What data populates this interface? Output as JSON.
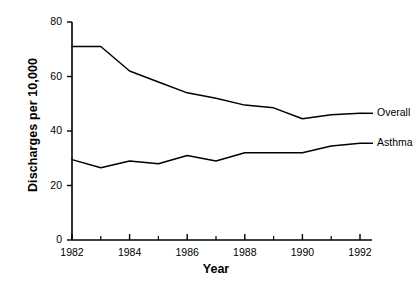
{
  "chart_data": {
    "type": "line",
    "title": "",
    "xlabel": "Year",
    "ylabel": "Discharges per 10,000",
    "x": [
      1982,
      1983,
      1984,
      1985,
      1986,
      1987,
      1988,
      1989,
      1990,
      1991,
      1992
    ],
    "xlim": [
      1982,
      1992
    ],
    "ylim": [
      0,
      80
    ],
    "xticks": [
      1982,
      1984,
      1986,
      1988,
      1990,
      1992
    ],
    "xtick_labels": [
      "1982",
      "1984",
      "1986",
      "1988",
      "1990",
      "1992"
    ],
    "yticks": [
      0,
      20,
      40,
      60,
      80
    ],
    "ytick_labels": [
      "0",
      "20",
      "40",
      "60",
      "80"
    ],
    "xminor_ticks": [
      1983,
      1985,
      1987,
      1989,
      1991
    ],
    "grid": false,
    "legend_position": "right-inline",
    "line_color": "#000000",
    "background_color": "#ffffff",
    "series": [
      {
        "name": "Overall",
        "label": "Overall",
        "values": [
          71,
          71,
          62,
          58,
          54,
          52,
          49.5,
          48.5,
          44.5,
          46,
          46.5
        ]
      },
      {
        "name": "Asthma",
        "label": "Asthma",
        "values": [
          29.5,
          26.5,
          29,
          28,
          31,
          29,
          32,
          32,
          32,
          34.5,
          35.5
        ]
      }
    ]
  }
}
